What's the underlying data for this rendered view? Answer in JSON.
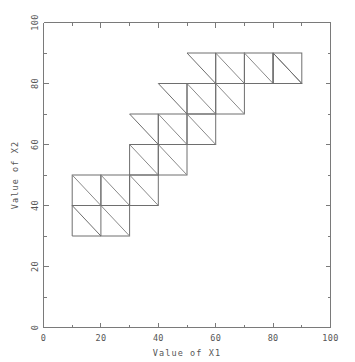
{
  "chart_data": {
    "type": "line",
    "title": "",
    "subtitle": "",
    "xlabel": "Value of X1",
    "ylabel": "Value of X2",
    "xlim": [
      0,
      100
    ],
    "ylim": [
      0,
      100
    ],
    "x_ticks": [
      0,
      20,
      40,
      60,
      80,
      100
    ],
    "y_ticks": [
      0,
      20,
      40,
      60,
      80,
      100
    ],
    "x_tick_labels": [
      "0",
      "20",
      "40",
      "60",
      "80",
      "100"
    ],
    "y_tick_labels": [
      "0",
      "20",
      "40",
      "60",
      "80",
      "100"
    ],
    "x_minor_ticks": [
      10,
      30,
      50,
      70,
      90
    ],
    "y_minor_ticks": [
      10,
      30,
      50,
      70,
      90
    ],
    "grid": false,
    "legend": null,
    "legend_position": "none",
    "annotations": [],
    "cell_size": 10,
    "cells": [
      {
        "x0": 10,
        "y0": 40,
        "x1": 20,
        "y1": 50
      },
      {
        "x0": 20,
        "y0": 40,
        "x1": 30,
        "y1": 50
      },
      {
        "x0": 30,
        "y0": 40,
        "x1": 40,
        "y1": 50
      },
      {
        "x0": 20,
        "y0": 30,
        "x1": 30,
        "y1": 40
      },
      {
        "x0": 30,
        "y0": 50,
        "x1": 40,
        "y1": 60
      },
      {
        "x0": 40,
        "y0": 50,
        "x1": 50,
        "y1": 60
      },
      {
        "x0": 40,
        "y0": 60,
        "x1": 50,
        "y1": 70
      },
      {
        "x0": 50,
        "y0": 60,
        "x1": 60,
        "y1": 70
      },
      {
        "x0": 50,
        "y0": 70,
        "x1": 60,
        "y1": 80
      },
      {
        "x0": 60,
        "y0": 70,
        "x1": 70,
        "y1": 80
      },
      {
        "x0": 60,
        "y0": 80,
        "x1": 70,
        "y1": 90
      },
      {
        "x0": 70,
        "y0": 80,
        "x1": 80,
        "y1": 90
      },
      {
        "x0": 80,
        "y0": 80,
        "x1": 90,
        "y1": 90
      }
    ],
    "half_cells": [
      {
        "x0": 10,
        "y0": 30,
        "x1": 20,
        "y1": 40,
        "half": "lower"
      },
      {
        "x0": 30,
        "y0": 60,
        "x1": 40,
        "y1": 70,
        "half": "upper"
      },
      {
        "x0": 40,
        "y0": 70,
        "x1": 50,
        "y1": 80,
        "half": "upper"
      },
      {
        "x0": 50,
        "y0": 80,
        "x1": 60,
        "y1": 90,
        "half": "upper"
      },
      {
        "x0": 80,
        "y0": 80,
        "x1": 90,
        "y1": 90,
        "half": "lower"
      }
    ],
    "x_range_data": [
      10,
      90
    ],
    "y_range_data": [
      30,
      90
    ]
  },
  "axes": {
    "x_title": "Value of X1",
    "y_title": "Value of X2"
  },
  "colors": {
    "background": "#ffffff",
    "axis": "#7a7a7a",
    "tick_label": "#555555",
    "mesh_edge": "#6e6e6e",
    "mesh_diagonal": "#8a8a8a"
  }
}
